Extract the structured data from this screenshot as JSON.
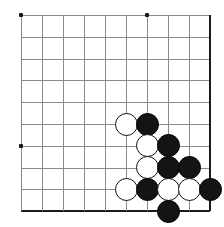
{
  "diagram": {
    "kind": "go-board-diagram",
    "board": {
      "columns": 10,
      "rows": 10,
      "cell_size": 21.0,
      "row_size": 21.8,
      "origin_x": 21,
      "origin_y": 15,
      "line_color": "#8a8a8a",
      "edge_color": "#1a1a1a",
      "background_color": "#ffffff",
      "edges": {
        "right_edge_column": 10,
        "bottom_edge_row": 10
      }
    },
    "star_points": [
      {
        "col": 1,
        "row": 1
      },
      {
        "col": 7,
        "row": 1
      },
      {
        "col": 1,
        "row": 7
      }
    ],
    "stones": [
      {
        "color": "white",
        "col": 6,
        "row": 6
      },
      {
        "color": "black",
        "col": 7,
        "row": 6
      },
      {
        "color": "white",
        "col": 7,
        "row": 7
      },
      {
        "color": "black",
        "col": 8,
        "row": 7
      },
      {
        "color": "white",
        "col": 7,
        "row": 8
      },
      {
        "color": "black",
        "col": 8,
        "row": 8
      },
      {
        "color": "black",
        "col": 9,
        "row": 8
      },
      {
        "color": "white",
        "col": 6,
        "row": 9
      },
      {
        "color": "black",
        "col": 7,
        "row": 9
      },
      {
        "color": "white",
        "col": 8,
        "row": 9
      },
      {
        "color": "white",
        "col": 9,
        "row": 9
      },
      {
        "color": "black",
        "col": 10,
        "row": 9
      },
      {
        "color": "black",
        "col": 8,
        "row": 10
      }
    ],
    "stone_diameter": 23,
    "stone_counts": {
      "black": 7,
      "white": 6
    }
  }
}
